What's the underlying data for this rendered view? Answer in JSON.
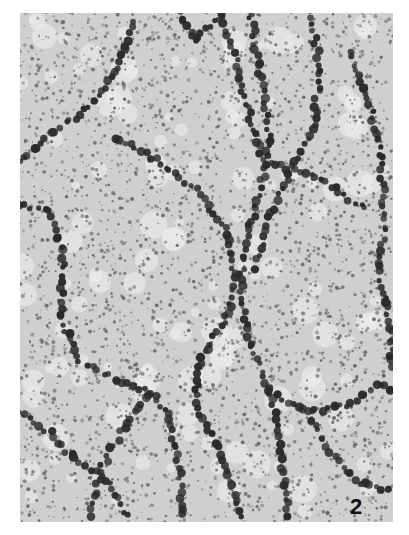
{
  "figure": {
    "panel_label": "2",
    "colors": {
      "background": "#ffffff",
      "field": "#cfcfcf",
      "speckle": "#5a5a5a",
      "bead": "#2a2a2a"
    },
    "chains": [
      [
        [
          0,
          150
        ],
        [
          30,
          120
        ],
        [
          70,
          95
        ],
        [
          95,
          60
        ],
        [
          110,
          20
        ],
        [
          115,
          0
        ]
      ],
      [
        [
          95,
          125
        ],
        [
          140,
          150
        ],
        [
          180,
          180
        ],
        [
          205,
          215
        ],
        [
          215,
          260
        ],
        [
          210,
          300
        ]
      ],
      [
        [
          0,
          190
        ],
        [
          30,
          200
        ],
        [
          45,
          250
        ],
        [
          40,
          300
        ],
        [
          60,
          350
        ],
        [
          95,
          365
        ],
        [
          130,
          380
        ],
        [
          150,
          400
        ],
        [
          160,
          460
        ],
        [
          165,
          509
        ]
      ],
      [
        [
          210,
          300
        ],
        [
          190,
          330
        ],
        [
          175,
          360
        ],
        [
          180,
          400
        ],
        [
          200,
          440
        ],
        [
          215,
          480
        ],
        [
          220,
          509
        ]
      ],
      [
        [
          230,
          0
        ],
        [
          240,
          60
        ],
        [
          250,
          120
        ],
        [
          240,
          180
        ],
        [
          225,
          230
        ],
        [
          220,
          280
        ],
        [
          230,
          330
        ],
        [
          250,
          380
        ],
        [
          260,
          430
        ],
        [
          270,
          509
        ]
      ],
      [
        [
          290,
          0
        ],
        [
          300,
          50
        ],
        [
          295,
          110
        ],
        [
          270,
          160
        ],
        [
          250,
          200
        ],
        [
          235,
          260
        ]
      ],
      [
        [
          330,
          40
        ],
        [
          350,
          90
        ],
        [
          360,
          140
        ],
        [
          365,
          200
        ],
        [
          360,
          260
        ],
        [
          370,
          320
        ],
        [
          373,
          360
        ]
      ],
      [
        [
          245,
          150
        ],
        [
          290,
          160
        ],
        [
          320,
          180
        ],
        [
          350,
          200
        ]
      ],
      [
        [
          130,
          380
        ],
        [
          100,
          420
        ],
        [
          80,
          460
        ],
        [
          70,
          509
        ]
      ],
      [
        [
          250,
          380
        ],
        [
          290,
          400
        ],
        [
          330,
          390
        ],
        [
          360,
          370
        ],
        [
          373,
          380
        ]
      ],
      [
        [
          0,
          400
        ],
        [
          30,
          420
        ],
        [
          60,
          450
        ],
        [
          90,
          470
        ],
        [
          110,
          509
        ]
      ],
      [
        [
          290,
          400
        ],
        [
          310,
          440
        ],
        [
          340,
          470
        ],
        [
          373,
          480
        ]
      ],
      [
        [
          200,
          0
        ],
        [
          215,
          40
        ],
        [
          225,
          90
        ],
        [
          245,
          150
        ]
      ],
      [
        [
          160,
          0
        ],
        [
          175,
          30
        ],
        [
          200,
          0
        ]
      ]
    ]
  }
}
